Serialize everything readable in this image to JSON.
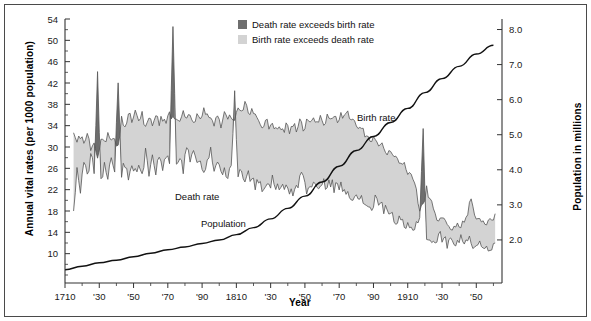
{
  "figure": {
    "background": "#ffffff",
    "border_color": "#4a4a4a"
  },
  "axes": {
    "left_title": "Annual vital rates (per 1000 population)",
    "right_title": "Population in millions",
    "x_title": "Year"
  },
  "legend": {
    "items": [
      {
        "label": "Death rate exceeds birth rate",
        "color": "#6e6e6e"
      },
      {
        "label": "Birth rate exceeds death rate",
        "color": "#d3d3d3"
      }
    ]
  },
  "annotations": [
    {
      "name": "birth-rate-annotation",
      "text": "Birth rate",
      "x": 352,
      "y": 116
    },
    {
      "name": "death-rate-annotation",
      "text": "Death rate",
      "x": 170,
      "y": 195
    },
    {
      "name": "population-annotation",
      "text": "Population",
      "x": 196,
      "y": 222
    }
  ],
  "chart_data": {
    "type": "area",
    "title": "",
    "subtitle": "",
    "xlabel": "Year",
    "ylabel": "Annual vital rates (per 1000 population)",
    "y2label": "Population in millions",
    "grid": false,
    "legend_position": "top-center",
    "xlim": [
      1710,
      1965
    ],
    "ylim": [
      6,
      54
    ],
    "y2lim": [
      1.0,
      8.3
    ],
    "xticks": [
      1710,
      1730,
      1750,
      1770,
      1790,
      1810,
      1830,
      1850,
      1870,
      1890,
      1910,
      1930,
      1950
    ],
    "xticklabels": [
      "1710",
      "'30",
      "'50",
      "'70",
      "'90",
      "1810",
      "'30",
      "'50",
      "'70",
      "'90",
      "1910",
      "'30",
      "'50"
    ],
    "xtick_minor_step": 10,
    "yticks": [
      10,
      14,
      18,
      22,
      26,
      30,
      34,
      38,
      42,
      46,
      50,
      54
    ],
    "yticklabels": [
      "10",
      "14",
      "18",
      "22",
      "26",
      "30",
      "34",
      "38",
      "42",
      "46",
      "50",
      "54"
    ],
    "y2ticks": [
      2.0,
      3.0,
      4.0,
      5.0,
      6.0,
      7.0,
      8.0
    ],
    "y2ticklabels": [
      "2.0",
      "3.0",
      "4.0",
      "5.0",
      "6.0",
      "7.0",
      "8.0"
    ],
    "fill_above_color": "#d3d3d3",
    "fill_crisis_color": "#6e6e6e",
    "line_color": "#555555",
    "population_line_color": "#111111",
    "series": [
      {
        "name": "Birth rate",
        "axis": "left",
        "x": [
          1715,
          1717,
          1719,
          1721,
          1723,
          1725,
          1727,
          1729,
          1731,
          1733,
          1735,
          1737,
          1739,
          1741,
          1743,
          1745,
          1747,
          1749,
          1751,
          1753,
          1755,
          1757,
          1759,
          1761,
          1763,
          1765,
          1767,
          1769,
          1771,
          1773,
          1775,
          1777,
          1779,
          1781,
          1783,
          1785,
          1787,
          1789,
          1791,
          1793,
          1795,
          1797,
          1799,
          1801,
          1803,
          1805,
          1807,
          1809,
          1811,
          1813,
          1815,
          1817,
          1819,
          1821,
          1823,
          1825,
          1827,
          1829,
          1831,
          1833,
          1835,
          1837,
          1839,
          1841,
          1843,
          1845,
          1847,
          1849,
          1851,
          1853,
          1855,
          1857,
          1859,
          1861,
          1863,
          1865,
          1867,
          1869,
          1871,
          1873,
          1875,
          1877,
          1879,
          1881,
          1883,
          1885,
          1887,
          1889,
          1891,
          1893,
          1895,
          1897,
          1899,
          1901,
          1903,
          1905,
          1907,
          1909,
          1911,
          1913,
          1915,
          1917,
          1919,
          1921,
          1923,
          1925,
          1927,
          1929,
          1931,
          1933,
          1935,
          1937,
          1939,
          1941,
          1943,
          1945,
          1947,
          1949,
          1951,
          1953,
          1955,
          1957,
          1959,
          1961
        ],
        "values": [
          33.0,
          31.5,
          32.2,
          30.6,
          31.8,
          29.8,
          30.2,
          28.6,
          31.6,
          30.4,
          32.4,
          31.0,
          31.5,
          30.0,
          35.5,
          34.0,
          36.5,
          35.0,
          37.5,
          34.5,
          36.0,
          33.5,
          35.0,
          34.0,
          36.0,
          34.5,
          35.5,
          34.0,
          36.5,
          35.0,
          36.0,
          34.5,
          37.0,
          35.5,
          36.5,
          35.0,
          36.0,
          35.0,
          37.0,
          35.5,
          36.0,
          34.5,
          35.5,
          34.0,
          36.5,
          34.5,
          36.0,
          34.5,
          37.5,
          36.0,
          38.0,
          36.5,
          37.0,
          36.0,
          35.0,
          34.0,
          35.0,
          34.0,
          34.5,
          33.5,
          34.0,
          33.0,
          34.0,
          33.0,
          34.0,
          33.5,
          34.5,
          33.5,
          34.5,
          34.0,
          35.0,
          34.5,
          35.5,
          34.5,
          35.5,
          35.0,
          36.0,
          35.0,
          36.0,
          35.5,
          36.0,
          35.0,
          34.5,
          33.5,
          33.0,
          32.5,
          32.0,
          31.0,
          31.5,
          30.5,
          30.0,
          29.5,
          29.0,
          28.5,
          28.0,
          27.5,
          27.0,
          26.0,
          25.0,
          24.0,
          22.0,
          18.0,
          19.0,
          22.5,
          20.0,
          18.5,
          17.0,
          16.5,
          16.0,
          15.0,
          15.0,
          15.0,
          15.0,
          14.5,
          16.5,
          18.0,
          21.0,
          17.5,
          16.0,
          16.0,
          15.5,
          16.5,
          16.5,
          17.5
        ]
      },
      {
        "name": "Death rate",
        "axis": "left",
        "x": [
          1715,
          1717,
          1719,
          1721,
          1723,
          1725,
          1727,
          1729,
          1731,
          1733,
          1735,
          1737,
          1739,
          1741,
          1743,
          1745,
          1747,
          1749,
          1751,
          1753,
          1755,
          1757,
          1759,
          1761,
          1763,
          1765,
          1767,
          1769,
          1771,
          1773,
          1775,
          1777,
          1779,
          1781,
          1783,
          1785,
          1787,
          1789,
          1791,
          1793,
          1795,
          1797,
          1799,
          1801,
          1803,
          1805,
          1807,
          1809,
          1811,
          1813,
          1815,
          1817,
          1819,
          1821,
          1823,
          1825,
          1827,
          1829,
          1831,
          1833,
          1835,
          1837,
          1839,
          1841,
          1843,
          1845,
          1847,
          1849,
          1851,
          1853,
          1855,
          1857,
          1859,
          1861,
          1863,
          1865,
          1867,
          1869,
          1871,
          1873,
          1875,
          1877,
          1879,
          1881,
          1883,
          1885,
          1887,
          1889,
          1891,
          1893,
          1895,
          1897,
          1899,
          1901,
          1903,
          1905,
          1907,
          1909,
          1911,
          1913,
          1915,
          1917,
          1919,
          1921,
          1923,
          1925,
          1927,
          1929,
          1931,
          1933,
          1935,
          1937,
          1939,
          1941,
          1943,
          1945,
          1947,
          1949,
          1951,
          1953,
          1955,
          1957,
          1959,
          1961
        ],
        "values": [
          18.0,
          26.0,
          22.0,
          27.5,
          24.0,
          29.0,
          26.0,
          44.0,
          23.0,
          27.0,
          24.0,
          28.0,
          26.0,
          43.0,
          25.0,
          27.0,
          24.0,
          26.5,
          25.0,
          27.0,
          24.0,
          29.0,
          25.0,
          27.5,
          25.5,
          28.0,
          26.0,
          28.5,
          27.0,
          52.5,
          26.5,
          28.0,
          25.5,
          30.0,
          27.0,
          28.5,
          26.0,
          27.5,
          25.0,
          26.5,
          29.0,
          26.0,
          27.0,
          25.5,
          26.0,
          24.5,
          25.5,
          40.0,
          24.5,
          26.0,
          23.5,
          25.0,
          24.0,
          22.5,
          23.5,
          22.0,
          23.0,
          22.5,
          24.0,
          22.5,
          23.0,
          22.5,
          22.5,
          22.0,
          21.5,
          22.0,
          24.5,
          24.5,
          22.0,
          22.5,
          23.0,
          22.5,
          22.0,
          23.0,
          23.0,
          23.5,
          22.5,
          22.5,
          22.5,
          22.0,
          22.0,
          21.0,
          21.0,
          19.5,
          20.0,
          19.5,
          19.0,
          18.5,
          20.5,
          19.0,
          19.0,
          18.0,
          18.5,
          17.0,
          16.0,
          16.0,
          15.5,
          15.0,
          14.5,
          14.0,
          15.5,
          17.5,
          33.0,
          12.5,
          13.0,
          12.0,
          12.5,
          13.5,
          12.5,
          12.0,
          12.0,
          12.5,
          12.5,
          13.0,
          12.5,
          12.0,
          12.5,
          11.5,
          12.0,
          11.5,
          11.5,
          11.5,
          11.5,
          12.0
        ]
      },
      {
        "name": "Population",
        "axis": "right",
        "x": [
          1710,
          1720,
          1730,
          1740,
          1750,
          1760,
          1770,
          1780,
          1790,
          1800,
          1810,
          1820,
          1830,
          1840,
          1850,
          1860,
          1870,
          1880,
          1890,
          1900,
          1910,
          1920,
          1930,
          1940,
          1950,
          1960
        ],
        "values": [
          1.15,
          1.25,
          1.35,
          1.42,
          1.52,
          1.62,
          1.72,
          1.8,
          1.9,
          2.0,
          2.15,
          2.35,
          2.6,
          2.9,
          3.25,
          3.65,
          4.1,
          4.55,
          4.95,
          5.35,
          5.75,
          6.2,
          6.6,
          6.95,
          7.3,
          7.55
        ]
      }
    ],
    "notes": [
      "Shaded band between birth and death rate curves.",
      "Light gray where birth rate exceeds death rate (natural increase).",
      "Dark gray spikes where death rate exceeds birth rate (mortality crises).",
      "Major mortality crises visible around 1729, 1741, 1772, 1809 and 1918."
    ]
  }
}
